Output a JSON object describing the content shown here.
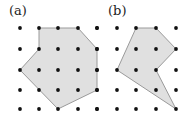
{
  "panels": [
    {
      "label": "(a)",
      "label_pos": [
        9,
        3
      ],
      "grid": {
        "xs": [
          20,
          39,
          58,
          78,
          97
        ],
        "ys": [
          28,
          49,
          70,
          90,
          109
        ]
      },
      "polygon": [
        [
          39,
          28
        ],
        [
          78,
          28
        ],
        [
          97,
          49
        ],
        [
          97,
          90
        ],
        [
          58,
          109
        ],
        [
          20,
          70
        ],
        [
          39,
          49
        ]
      ]
    },
    {
      "label": "(b)",
      "label_pos": [
        108,
        3
      ],
      "grid": {
        "xs": [
          97,
          117,
          136,
          156,
          176
        ],
        "ys": [
          28,
          49,
          70,
          90,
          109
        ]
      },
      "polygon": [
        [
          136,
          28
        ],
        [
          156,
          28
        ],
        [
          176,
          49
        ],
        [
          156,
          70
        ],
        [
          176,
          109
        ],
        [
          117,
          70
        ]
      ]
    }
  ],
  "colors": {
    "fill": "#e0e0e0",
    "stroke": "#9a9a9a",
    "dot": "#111111"
  }
}
